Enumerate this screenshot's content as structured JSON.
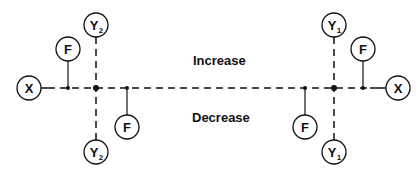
{
  "diagram": {
    "labels": {
      "increase": "Increase",
      "decrease": "Decrease"
    },
    "nodes": {
      "x_left": {
        "text": "X"
      },
      "x_right": {
        "text": "X"
      },
      "f_left_top": {
        "text": "F"
      },
      "f_left_bottom": {
        "text": "F"
      },
      "f_right_top": {
        "text": "F"
      },
      "f_right_bottom": {
        "text": "F"
      },
      "y2_top": {
        "text": "Y",
        "sub": "2"
      },
      "y2_bottom": {
        "text": "Y",
        "sub": "2"
      },
      "y1_top": {
        "text": "Y",
        "sub": "1"
      },
      "y1_bottom": {
        "text": "Y",
        "sub": "1"
      }
    },
    "colors": {
      "stroke": "#111111",
      "background": "#ffffff"
    }
  }
}
